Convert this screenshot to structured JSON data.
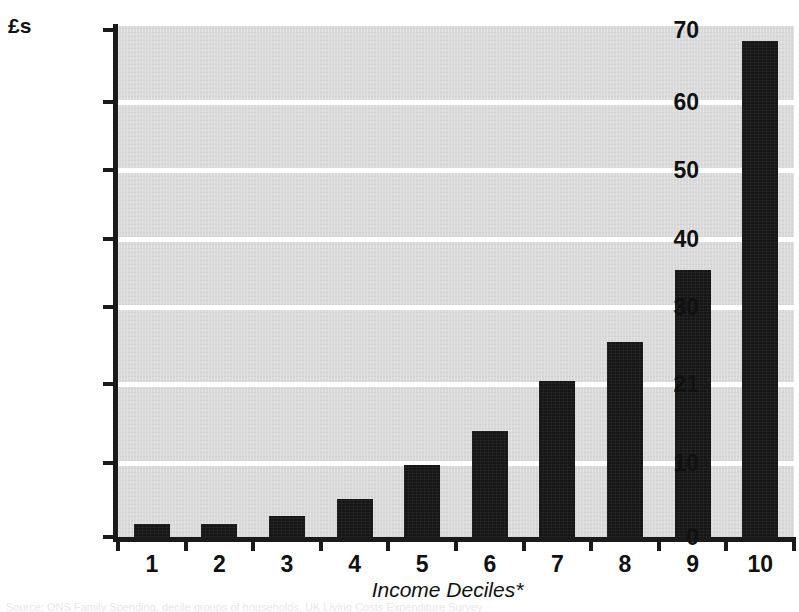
{
  "chart_data": {
    "type": "bar",
    "title": "",
    "unit_label": "£s",
    "xlabel": "Income Deciles*",
    "ylabel": "£s",
    "categories": [
      "1",
      "2",
      "3",
      "4",
      "5",
      "6",
      "7",
      "8",
      "9",
      "10"
    ],
    "values": [
      1.8,
      1.8,
      2.9,
      5.2,
      9.7,
      14.4,
      21.3,
      25.9,
      35.5,
      68.5
    ],
    "ytick_labels": [
      "70",
      "60",
      "50",
      "40",
      "30",
      "21",
      "10",
      "0"
    ],
    "ytick_values": [
      70,
      60,
      50,
      40,
      30,
      21,
      10,
      0
    ],
    "ylim": [
      0,
      70
    ],
    "grid": true,
    "legend": "none",
    "bar_color": "#161616",
    "plot_background": "#d9d9d9",
    "gridline_color": "#ffffff",
    "axis_color": "#1a1a1a",
    "footnote": "Source: ONS Family Spending, decile groups of households, UK Living Costs Expenditure Survey"
  },
  "labels": {
    "unit": "£s",
    "x_axis_title": "Income Deciles*"
  }
}
